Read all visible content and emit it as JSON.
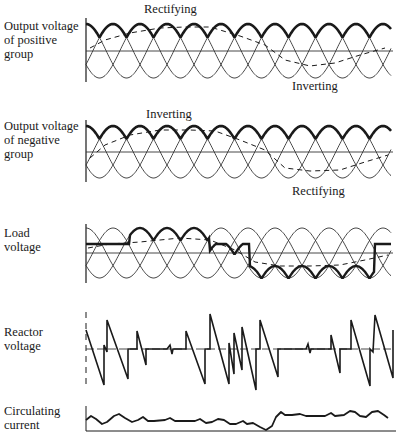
{
  "panels": [
    {
      "id": "positive",
      "label": "Output voltage\nof positive\ngroup",
      "annotations": [
        {
          "text": "Rectifying",
          "x": 144,
          "y": 2
        },
        {
          "text": "Inverting",
          "x": 292,
          "y": 79
        }
      ]
    },
    {
      "id": "negative",
      "label": "Output voltage\nof negative\ngroup",
      "annotations": [
        {
          "text": "Inverting",
          "x": 146,
          "y": 107
        },
        {
          "text": "Rectifying",
          "x": 292,
          "y": 184
        }
      ]
    },
    {
      "id": "load",
      "label": "Load\nvoltage",
      "annotations": []
    },
    {
      "id": "reactor",
      "label": "Reactor\nvoltage",
      "annotations": []
    },
    {
      "id": "circulating",
      "label": "Circulating\ncurrent",
      "annotations": []
    }
  ],
  "colors": {
    "ink": "#1a1a1a",
    "thin": "#333333",
    "background": "#ffffff"
  },
  "geometry": {
    "x_start": 86,
    "x_end": 391,
    "phase_period": 81,
    "positive": {
      "center": 51,
      "amp": 27,
      "axis_top": 18,
      "axis_bottom": 82
    },
    "negative": {
      "center": 152,
      "amp": 26,
      "axis_top": 120,
      "axis_bottom": 182
    },
    "load": {
      "center": 253,
      "amp": 25,
      "axis_top": 224,
      "axis_bottom": 283
    },
    "reactor": {
      "center": 349,
      "axis_top": 312,
      "axis_bottom": 388
    },
    "circulating": {
      "baseline": 431,
      "axis_top": 406
    }
  },
  "traces": {
    "reactor": [
      [
        86,
        330
      ],
      [
        104,
        385
      ],
      [
        104,
        345
      ],
      [
        107,
        352
      ],
      [
        107,
        320
      ],
      [
        128,
        379
      ],
      [
        128,
        349
      ],
      [
        137,
        349
      ],
      [
        137,
        331
      ],
      [
        146,
        365
      ],
      [
        146,
        349
      ],
      [
        167,
        349
      ],
      [
        170,
        345
      ],
      [
        172,
        354
      ],
      [
        173,
        349
      ],
      [
        186,
        349
      ],
      [
        186,
        331
      ],
      [
        205,
        384
      ],
      [
        205,
        349
      ],
      [
        210,
        349
      ],
      [
        210,
        314
      ],
      [
        229,
        384
      ],
      [
        229,
        343
      ],
      [
        234,
        374
      ],
      [
        234,
        333
      ],
      [
        242,
        370
      ],
      [
        242,
        327
      ],
      [
        256,
        390
      ],
      [
        256,
        349
      ],
      [
        260,
        349
      ],
      [
        260,
        320
      ],
      [
        278,
        377
      ],
      [
        278,
        349
      ],
      [
        306,
        349
      ],
      [
        308,
        344
      ],
      [
        310,
        353
      ],
      [
        311,
        349
      ],
      [
        331,
        349
      ],
      [
        331,
        335
      ],
      [
        340,
        373
      ],
      [
        340,
        349
      ],
      [
        351,
        349
      ],
      [
        351,
        320
      ],
      [
        370,
        386
      ],
      [
        370,
        349
      ],
      [
        373,
        352
      ],
      [
        375,
        315
      ],
      [
        393,
        378
      ],
      [
        393,
        330
      ]
    ],
    "circulating": [
      [
        86,
        420
      ],
      [
        91,
        416
      ],
      [
        96,
        419
      ],
      [
        102,
        424
      ],
      [
        107,
        422
      ],
      [
        114,
        416
      ],
      [
        119,
        414
      ],
      [
        125,
        418
      ],
      [
        132,
        422
      ],
      [
        138,
        420
      ],
      [
        143,
        417
      ],
      [
        148,
        421
      ],
      [
        154,
        421
      ],
      [
        165,
        420
      ],
      [
        170,
        418
      ],
      [
        175,
        421
      ],
      [
        183,
        421
      ],
      [
        195,
        421
      ],
      [
        200,
        419
      ],
      [
        206,
        423
      ],
      [
        212,
        422
      ],
      [
        218,
        419
      ],
      [
        224,
        420
      ],
      [
        230,
        424
      ],
      [
        236,
        424
      ],
      [
        243,
        421
      ],
      [
        247,
        424
      ],
      [
        253,
        423
      ],
      [
        260,
        427
      ],
      [
        266,
        430
      ],
      [
        272,
        426
      ],
      [
        276,
        417
      ],
      [
        281,
        412
      ],
      [
        285,
        415
      ],
      [
        292,
        415
      ],
      [
        300,
        414
      ],
      [
        306,
        416
      ],
      [
        315,
        416
      ],
      [
        325,
        416
      ],
      [
        331,
        413
      ],
      [
        335,
        416
      ],
      [
        344,
        415
      ],
      [
        350,
        411
      ],
      [
        355,
        412
      ],
      [
        360,
        416
      ],
      [
        366,
        417
      ],
      [
        372,
        412
      ],
      [
        378,
        411
      ],
      [
        384,
        415
      ],
      [
        388,
        418
      ]
    ],
    "positive_mean": [
      [
        90,
        48
      ],
      [
        105,
        40
      ],
      [
        130,
        33
      ],
      [
        160,
        28
      ],
      [
        185,
        27
      ],
      [
        210,
        27
      ],
      [
        240,
        36
      ],
      [
        265,
        45
      ],
      [
        285,
        60
      ],
      [
        310,
        66
      ],
      [
        335,
        63
      ],
      [
        360,
        55
      ],
      [
        385,
        48
      ]
    ],
    "negative_mean": [
      [
        90,
        158
      ],
      [
        105,
        145
      ],
      [
        130,
        135
      ],
      [
        160,
        130
      ],
      [
        190,
        130
      ],
      [
        215,
        131
      ],
      [
        240,
        140
      ],
      [
        265,
        150
      ],
      [
        285,
        168
      ],
      [
        310,
        171
      ],
      [
        340,
        170
      ],
      [
        365,
        162
      ],
      [
        388,
        155
      ]
    ],
    "load_mean": [
      [
        88,
        248
      ],
      [
        110,
        244
      ],
      [
        140,
        242
      ],
      [
        180,
        238
      ],
      [
        210,
        240
      ],
      [
        235,
        250
      ],
      [
        255,
        262
      ],
      [
        280,
        266
      ],
      [
        310,
        266
      ],
      [
        340,
        265
      ],
      [
        365,
        260
      ],
      [
        388,
        255
      ]
    ]
  }
}
